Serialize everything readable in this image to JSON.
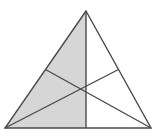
{
  "figure": {
    "title": "Triangle with three medians, left half shaded",
    "type": "geometry-diagram",
    "canvas": {
      "width": 157,
      "height": 138
    },
    "colors": {
      "stroke": "#4a4a4a",
      "shade_fill": "#d6d6d6",
      "background": "#ffffff"
    },
    "stroke_width": 1.4,
    "vertices": {
      "apex": {
        "name": "A",
        "x": 86,
        "y": 11
      },
      "bottom_left": {
        "name": "B",
        "x": 5,
        "y": 128
      },
      "bottom_right": {
        "name": "C",
        "x": 151,
        "y": 128
      }
    },
    "midpoints": {
      "left_edge": {
        "name": "M_AB",
        "x": 45.5,
        "y": 69.5
      },
      "right_edge": {
        "name": "M_AC",
        "x": 118.5,
        "y": 69.5
      },
      "bottom_edge": {
        "name": "M_BC",
        "x": 86,
        "y": 128
      }
    },
    "centroid": {
      "name": "G",
      "x": 86,
      "y": 89
    },
    "outline_path": "M 86,11 L 5,128 L 151,128 Z",
    "medians": [
      {
        "name": "median-apex-to-bottom-midpoint",
        "from": "apex",
        "to": "bottom_edge_midpoint",
        "x1": 86,
        "y1": 11,
        "x2": 86,
        "y2": 128
      },
      {
        "name": "median-bottomleft-to-right-midpoint",
        "from": "bottom_left",
        "to": "right_edge_midpoint",
        "x1": 5,
        "y1": 128,
        "x2": 118.5,
        "y2": 69.5
      },
      {
        "name": "median-bottomright-to-left-midpoint",
        "from": "bottom_right",
        "to": "left_edge_midpoint",
        "x1": 151,
        "y1": 128,
        "x2": 45.5,
        "y2": 69.5
      }
    ],
    "shaded_path": "M 86,11 L 5,128 L 86,128 Z",
    "shaded_description": "left half of the triangle bounded by apex, bottom-left vertex and bottom-edge midpoint"
  }
}
